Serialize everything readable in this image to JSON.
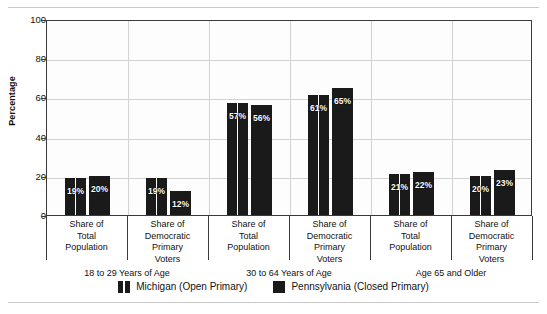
{
  "chart_data": {
    "type": "bar",
    "title": "",
    "xlabel": "",
    "ylabel": "Percentage",
    "ylim": [
      0,
      100
    ],
    "yticks": [
      0,
      20,
      40,
      60,
      80,
      100
    ],
    "grid": true,
    "legend_position": "bottom",
    "value_suffix": "%",
    "categories": [
      "Share of Total Population",
      "Share of Democratic Primary Voters",
      "Share of Total Population",
      "Share of Democratic Primary Voters",
      "Share of Total Population",
      "Share of Democratic Primary Voters"
    ],
    "category_lines": [
      [
        "Share of",
        "Total",
        "Population"
      ],
      [
        "Share of",
        "Democratic",
        "Primary",
        "Voters"
      ],
      [
        "Share of",
        "Total",
        "Population"
      ],
      [
        "Share of",
        "Democratic",
        "Primary",
        "Voters"
      ],
      [
        "Share of",
        "Total",
        "Population"
      ],
      [
        "Share of",
        "Democratic",
        "Primary",
        "Voters"
      ]
    ],
    "groups": [
      {
        "label": "18 to 29 Years of Age",
        "categories": [
          0,
          1
        ]
      },
      {
        "label": "30 to 64 Years of Age",
        "categories": [
          2,
          3
        ]
      },
      {
        "label": "Age 65 and Older",
        "categories": [
          4,
          5
        ]
      }
    ],
    "series": [
      {
        "name": "Michigan (Open Primary)",
        "color": "#1a1a1a",
        "pattern": "vertical-split",
        "values": [
          19,
          19,
          57,
          61,
          21,
          20
        ],
        "labels": [
          "19%",
          "19%",
          "57%",
          "61%",
          "21%",
          "20%"
        ]
      },
      {
        "name": "Pennsylvania (Closed Primary)",
        "color": "#1a1a1a",
        "pattern": "solid",
        "values": [
          20,
          12,
          56,
          65,
          22,
          23
        ],
        "labels": [
          "20%",
          "12%",
          "56%",
          "65%",
          "22%",
          "23%"
        ]
      }
    ]
  },
  "axis": {
    "y_title": "Percentage",
    "y_ticks": [
      "100",
      "80",
      "60",
      "40",
      "20",
      "0"
    ]
  },
  "legend": {
    "items": [
      {
        "label": "Michigan (Open Primary)",
        "pattern": "vertical-split"
      },
      {
        "label": "Pennsylvania (Closed Primary)",
        "pattern": "solid"
      }
    ]
  }
}
